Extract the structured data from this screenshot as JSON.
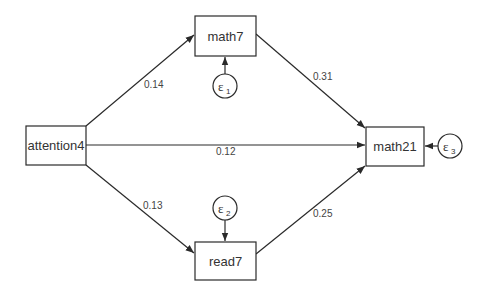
{
  "diagram": {
    "type": "path-diagram",
    "nodes": {
      "attention4": {
        "label": "attention4"
      },
      "math7": {
        "label": "math7"
      },
      "read7": {
        "label": "read7"
      },
      "math21": {
        "label": "math21"
      }
    },
    "errors": {
      "e1": {
        "symbol": "ε",
        "sub": "1",
        "target": "math7"
      },
      "e2": {
        "symbol": "ε",
        "sub": "2",
        "target": "read7"
      },
      "e3": {
        "symbol": "ε",
        "sub": "3",
        "target": "math21"
      }
    },
    "edges": [
      {
        "from": "attention4",
        "to": "math7",
        "coef": "0.14"
      },
      {
        "from": "attention4",
        "to": "math21",
        "coef": "0.12"
      },
      {
        "from": "attention4",
        "to": "read7",
        "coef": "0.13"
      },
      {
        "from": "math7",
        "to": "math21",
        "coef": "0.31"
      },
      {
        "from": "read7",
        "to": "math21",
        "coef": "0.25"
      }
    ]
  }
}
